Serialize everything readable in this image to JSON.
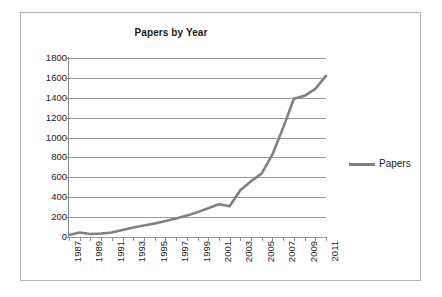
{
  "chart_data": {
    "type": "line",
    "title": "Papers by Year",
    "xlabel": "",
    "ylabel": "",
    "ylim": [
      0,
      1800
    ],
    "ytick_step": 200,
    "yticks": [
      1800,
      1600,
      1400,
      1200,
      1000,
      800,
      600,
      400,
      200,
      0
    ],
    "grid": true,
    "grid_axis": "y",
    "legend_position": "right",
    "x": [
      1987,
      1988,
      1989,
      1990,
      1991,
      1992,
      1993,
      1994,
      1995,
      1996,
      1997,
      1998,
      1999,
      2000,
      2001,
      2002,
      2003,
      2004,
      2005,
      2006,
      2007,
      2008,
      2009,
      2010,
      2011
    ],
    "xtick_labels": [
      "1987",
      "1989",
      "1991",
      "1993",
      "1995",
      "1997",
      "1999",
      "2001",
      "2003",
      "2005",
      "2007",
      "2009",
      "2011"
    ],
    "xtick_values": [
      1987,
      1989,
      1991,
      1993,
      1995,
      1997,
      1999,
      2001,
      2003,
      2005,
      2007,
      2009,
      2011
    ],
    "series": [
      {
        "name": "Papers",
        "color": "#808080",
        "values": [
          20,
          45,
          30,
          35,
          45,
          70,
          95,
          115,
          135,
          160,
          185,
          215,
          250,
          290,
          330,
          310,
          470,
          560,
          640,
          830,
          1100,
          1390,
          1420,
          1490,
          1620
        ]
      }
    ]
  },
  "legend": {
    "entries": [
      {
        "label": "Papers",
        "color": "#808080"
      }
    ]
  },
  "colors": {
    "series": "#808080",
    "gridline": "#9a9a9a",
    "axis": "#8c8c8c",
    "border": "#b4b4b4",
    "text": "#1a1a1a",
    "background": "#ffffff"
  }
}
